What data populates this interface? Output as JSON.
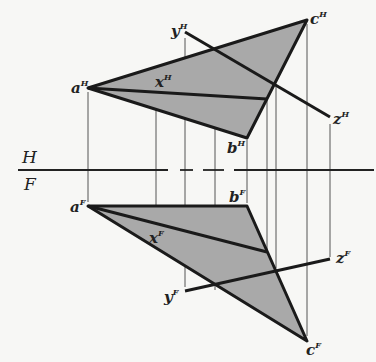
{
  "diagram": {
    "type": "descriptive-geometry orthographic projection",
    "fold_line": {
      "upper_label": "H",
      "lower_label": "F"
    },
    "colors": {
      "fill": "#a9a9a9",
      "line": "#1a1a1a",
      "projector": "#444444",
      "background": "#f7f7f5"
    },
    "views": {
      "horizontal": {
        "points": {
          "a": {
            "label": "a",
            "sup": "H"
          },
          "b": {
            "label": "b",
            "sup": "H"
          },
          "c": {
            "label": "c",
            "sup": "H"
          },
          "x": {
            "label": "x",
            "sup": "H"
          },
          "y": {
            "label": "y",
            "sup": "H"
          },
          "z": {
            "label": "z",
            "sup": "H"
          }
        }
      },
      "frontal": {
        "points": {
          "a": {
            "label": "a",
            "sup": "F"
          },
          "b": {
            "label": "b",
            "sup": "F"
          },
          "c": {
            "label": "c",
            "sup": "F"
          },
          "x": {
            "label": "x",
            "sup": "F"
          },
          "y": {
            "label": "y",
            "sup": "F"
          },
          "z": {
            "label": "z",
            "sup": "F"
          }
        }
      }
    }
  }
}
